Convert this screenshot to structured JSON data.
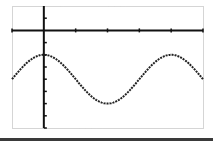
{
  "chart_data": {
    "type": "line",
    "title": "",
    "xlabel": "",
    "ylabel": "",
    "function": "y = 2cos(x) - 4",
    "x_tick_unit": "pi/2",
    "y_tick_unit": 1,
    "xlim": [
      -1.5708,
      7.854
    ],
    "ylim": [
      -8,
      2
    ],
    "x_ticks": [
      -1.5708,
      0,
      1.5708,
      3.1416,
      4.7124,
      6.2832,
      7.854
    ],
    "y_ticks": [
      1,
      0,
      -1,
      -2,
      -3,
      -4,
      -5,
      -6,
      -7,
      -8
    ],
    "grid": false,
    "legend": null,
    "series": [
      {
        "name": "curve",
        "x": [
          -1.5708,
          -0.7854,
          0,
          0.7854,
          1.5708,
          2.3562,
          3.1416,
          3.927,
          4.7124,
          5.4978,
          6.2832,
          7.0686,
          7.854
        ],
        "values": [
          -4,
          -2.586,
          -2,
          -2.586,
          -4,
          -5.414,
          -6,
          -5.414,
          -4,
          -2.586,
          -2,
          -2.586,
          -4
        ]
      }
    ],
    "colors": {
      "curve": "#222222",
      "axes": "#111111",
      "frame": "#aaaaaa",
      "bottom_bar": "#3a3a3a"
    }
  }
}
